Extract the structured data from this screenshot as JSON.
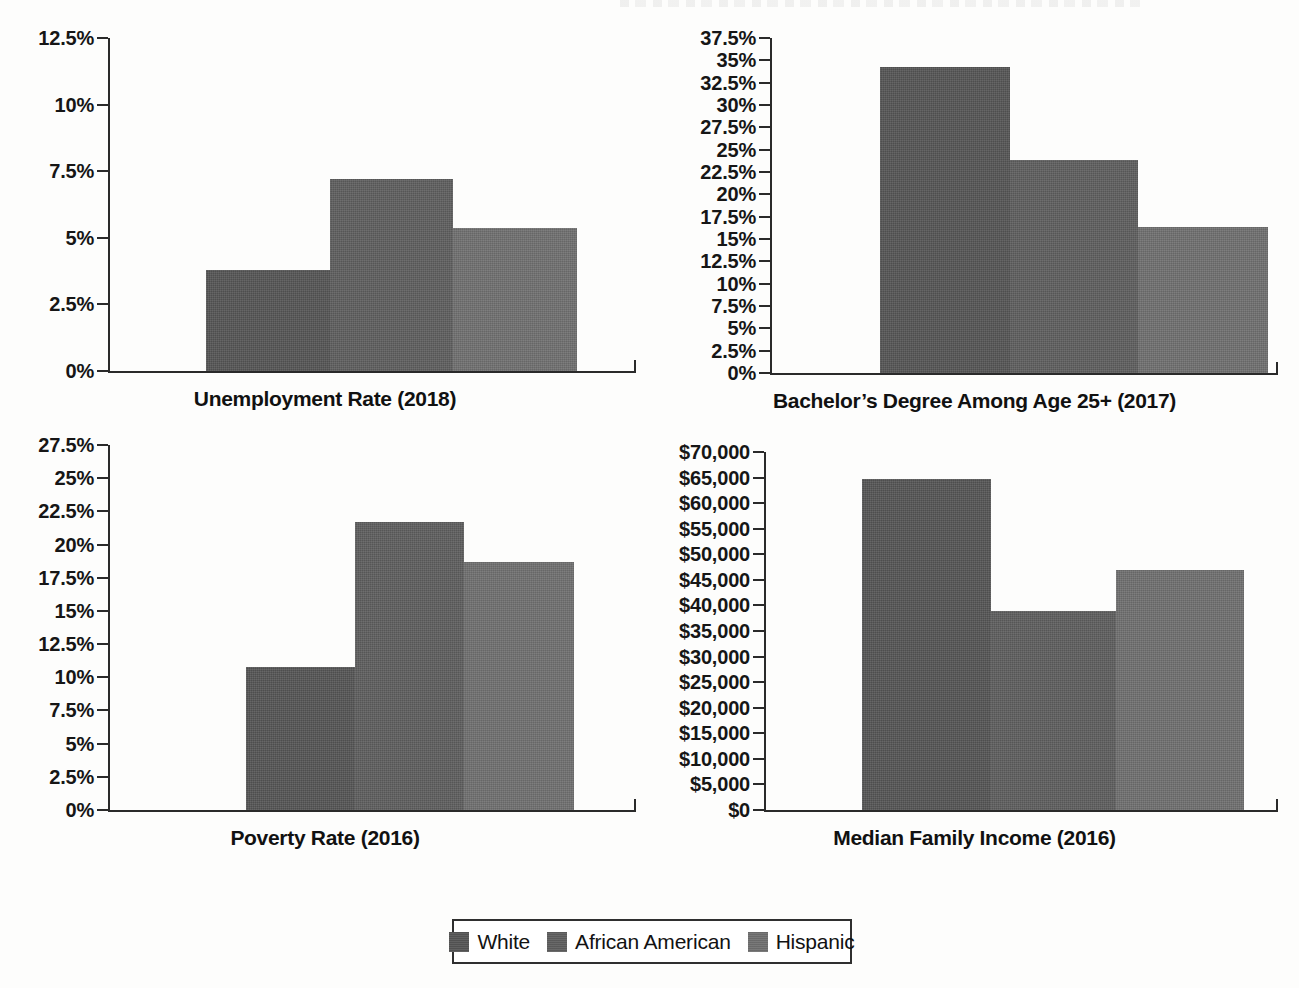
{
  "legend": {
    "items": [
      {
        "label": "White",
        "color": "#555555"
      },
      {
        "label": "African American",
        "color": "#5e5e5e"
      },
      {
        "label": "Hispanic",
        "color": "#6f6f6f"
      }
    ]
  },
  "chart_data": [
    {
      "type": "bar",
      "title": "Unemployment Rate (2018)",
      "xlabel": "",
      "ylabel": "",
      "categories": [
        "White",
        "African American",
        "Hispanic"
      ],
      "values": [
        3.8,
        7.2,
        5.35
      ],
      "tick_labels": [
        "0%",
        "2.5%",
        "5%",
        "7.5%",
        "10%",
        "12.5%"
      ],
      "tick_values": [
        0,
        2.5,
        5,
        7.5,
        10,
        12.5
      ],
      "ylim": [
        0,
        12.5
      ],
      "grid": false,
      "legend_position": "bottom"
    },
    {
      "type": "bar",
      "title": "Bachelor’s Degree Among Age 25+ (2017)",
      "xlabel": "",
      "ylabel": "",
      "categories": [
        "White",
        "African American",
        "Hispanic"
      ],
      "values": [
        34.3,
        23.8,
        16.4
      ],
      "tick_labels": [
        "0%",
        "2.5%",
        "5%",
        "7.5%",
        "10%",
        "12.5%",
        "15%",
        "17.5%",
        "20%",
        "22.5%",
        "25%",
        "27.5%",
        "30%",
        "32.5%",
        "35%",
        "37.5%"
      ],
      "tick_values": [
        0,
        2.5,
        5,
        7.5,
        10,
        12.5,
        15,
        17.5,
        20,
        22.5,
        25,
        27.5,
        30,
        32.5,
        35,
        37.5
      ],
      "ylim": [
        0,
        37.5
      ],
      "grid": false,
      "legend_position": "bottom"
    },
    {
      "type": "bar",
      "title": "Poverty Rate (2016)",
      "xlabel": "",
      "ylabel": "",
      "categories": [
        "White",
        "African American",
        "Hispanic"
      ],
      "values": [
        10.8,
        21.7,
        18.65
      ],
      "tick_labels": [
        "0%",
        "2.5%",
        "5%",
        "7.5%",
        "10%",
        "12.5%",
        "15%",
        "17.5%",
        "20%",
        "22.5%",
        "25%",
        "27.5%"
      ],
      "tick_values": [
        0,
        2.5,
        5,
        7.5,
        10,
        12.5,
        15,
        17.5,
        20,
        22.5,
        25,
        27.5
      ],
      "ylim": [
        0,
        27.5
      ],
      "grid": false,
      "legend_position": "bottom"
    },
    {
      "type": "bar",
      "title": "Median Family Income (2016)",
      "xlabel": "",
      "ylabel": "",
      "categories": [
        "White",
        "African American",
        "Hispanic"
      ],
      "values": [
        64800,
        39000,
        47000
      ],
      "tick_labels": [
        "$0",
        "$5,000",
        "$10,000",
        "$15,000",
        "$20,000",
        "$25,000",
        "$30,000",
        "$35,000",
        "$40,000",
        "$45,000",
        "$50,000",
        "$55,000",
        "$60,000",
        "$65,000",
        "$70,000"
      ],
      "tick_values": [
        0,
        5000,
        10000,
        15000,
        20000,
        25000,
        30000,
        35000,
        40000,
        45000,
        50000,
        55000,
        60000,
        65000,
        70000
      ],
      "ylim": [
        0,
        70000
      ],
      "grid": false,
      "legend_position": "bottom"
    }
  ]
}
